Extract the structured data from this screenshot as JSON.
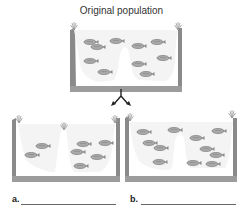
{
  "title": "Original population",
  "labels": {
    "a": "a.",
    "b": "b."
  },
  "colors": {
    "terrain": "#8a8a8a",
    "water": "#f4f4f4",
    "fish": "#9a9a9a",
    "text": "#333333"
  },
  "panels": [
    {
      "name": "original-population",
      "fish_count": 10
    },
    {
      "name": "outcome-a",
      "fish_count": 7
    },
    {
      "name": "outcome-b",
      "fish_count": 11
    }
  ]
}
